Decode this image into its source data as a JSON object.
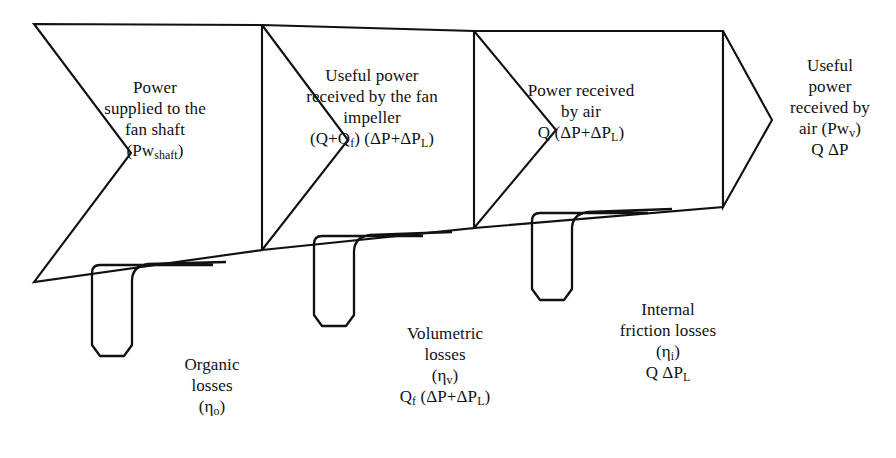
{
  "diagram": {
    "stroke_color": "#111111",
    "background_color": "#ffffff",
    "blocks": [
      {
        "id": "block-1",
        "name": "power-supplied-to-fan-shaft",
        "lines": [
          "Power",
          "supplied to the",
          "fan shaft",
          "(Pw",
          "shaft",
          ")"
        ],
        "line1": "Power",
        "line2": "supplied to the",
        "line3": "fan shaft",
        "symbol_prefix": "(Pw",
        "symbol_sub": "shaft",
        "symbol_suffix": ")"
      },
      {
        "id": "block-2",
        "name": "useful-power-received-by-fan-impeller",
        "line1": "Useful power",
        "line2": "received by the fan",
        "line3": "impeller",
        "formula_a": "(Q+Q",
        "formula_a_sub": "f",
        "formula_b": ") (ΔP+ΔP",
        "formula_b_sub": "L",
        "formula_c": ")"
      },
      {
        "id": "block-3",
        "name": "power-received-by-air",
        "line1": "Power received",
        "line2": "by air",
        "formula_a": "Q (ΔP+ΔP",
        "formula_a_sub": "L",
        "formula_b": ")"
      },
      {
        "id": "block-4",
        "name": "useful-power-received-by-air",
        "line1": "Useful",
        "line2": "power",
        "line3": "received by",
        "symbol_prefix": "air (Pw",
        "symbol_sub": "v",
        "symbol_suffix": ")",
        "formula": "Q ΔP"
      }
    ],
    "losses": [
      {
        "id": "loss-1",
        "name": "organic-losses",
        "line1": "Organic",
        "line2": "losses",
        "eta_prefix": "(η",
        "eta_sub": "o",
        "eta_suffix": ")",
        "formula": ""
      },
      {
        "id": "loss-2",
        "name": "volumetric-losses",
        "line1": "Volumetric",
        "line2": "losses",
        "eta_prefix": "(η",
        "eta_sub": "v",
        "eta_suffix": ")",
        "formula_a": "Q",
        "formula_a_sub": "f",
        "formula_b": " (ΔP+ΔP",
        "formula_b_sub": "L",
        "formula_c": ")"
      },
      {
        "id": "loss-3",
        "name": "internal-friction-losses",
        "line1": "Internal",
        "line2": "friction losses",
        "eta_prefix": "(η",
        "eta_sub": "i",
        "eta_suffix": ")",
        "formula_a": "Q ΔP",
        "formula_a_sub": "L"
      }
    ]
  }
}
